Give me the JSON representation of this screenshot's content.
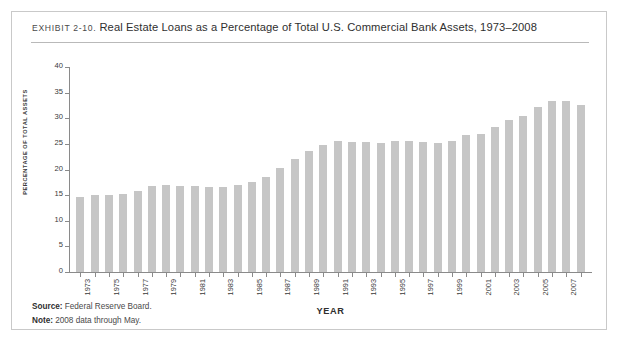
{
  "exhibit": {
    "kicker": "EXHIBIT 2-10.",
    "title": "Real Estate Loans as a Percentage of Total U.S. Commercial Bank Assets, 1973–2008"
  },
  "footnotes": [
    {
      "label": "Source:",
      "text": "Federal Reserve Board."
    },
    {
      "label": "Note:",
      "text": "2008 data through May."
    }
  ],
  "colors": {
    "bar": "#c6c6c6",
    "axis": "#8a8a8a",
    "frame": "#c9c9c9",
    "text": "#3a3a3a"
  },
  "chart_data": {
    "type": "bar",
    "title": "Real Estate Loans as a Percentage of Total U.S. Commercial Bank Assets, 1973–2008",
    "xlabel": "YEAR",
    "ylabel": "PERCENTAGE OF TOTAL ASSETS",
    "ylim": [
      0,
      40
    ],
    "yticks": [
      0,
      5,
      10,
      15,
      20,
      25,
      30,
      35,
      40
    ],
    "grid": false,
    "legend": "none",
    "x_tick_labels": [
      "1973",
      "1975",
      "1977",
      "1979",
      "1981",
      "1983",
      "1985",
      "1987",
      "1989",
      "1991",
      "1993",
      "1995",
      "1997",
      "1999",
      "2001",
      "2003",
      "2005",
      "2007"
    ],
    "categories": [
      "1973",
      "1974",
      "1975",
      "1976",
      "1977",
      "1978",
      "1979",
      "1980",
      "1981",
      "1982",
      "1983",
      "1984",
      "1985",
      "1986",
      "1987",
      "1988",
      "1989",
      "1990",
      "1991",
      "1992",
      "1993",
      "1994",
      "1995",
      "1996",
      "1997",
      "1998",
      "1999",
      "2000",
      "2001",
      "2002",
      "2003",
      "2004",
      "2005",
      "2006",
      "2007",
      "2008"
    ],
    "values": [
      14.7,
      15.0,
      15.0,
      15.2,
      15.8,
      16.8,
      17.0,
      16.8,
      16.7,
      16.5,
      16.6,
      17.0,
      17.5,
      18.6,
      20.2,
      22.1,
      23.6,
      24.8,
      25.6,
      25.3,
      25.4,
      25.2,
      25.5,
      25.6,
      25.3,
      25.1,
      25.5,
      26.7,
      27.0,
      28.2,
      29.7,
      30.5,
      32.2,
      33.3,
      33.4,
      32.6
    ]
  }
}
